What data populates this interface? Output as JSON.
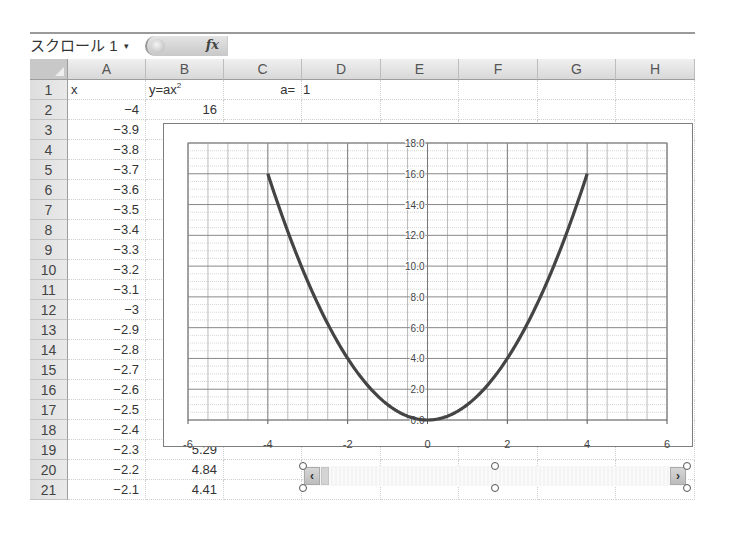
{
  "formula_bar": {
    "name_box": "スクロール 1",
    "name_box_arrow": "▾",
    "fx_label": "fx",
    "formula": ""
  },
  "columns": [
    "A",
    "B",
    "C",
    "D",
    "E",
    "F",
    "G",
    "H"
  ],
  "rows": [
    {
      "n": "1",
      "A": "x",
      "B": "y=ax",
      "B_sup": "2",
      "C": "a=",
      "D": "1"
    },
    {
      "n": "2",
      "A": "−4",
      "B": "16"
    },
    {
      "n": "3",
      "A": "−3.9"
    },
    {
      "n": "4",
      "A": "−3.8"
    },
    {
      "n": "5",
      "A": "−3.7"
    },
    {
      "n": "6",
      "A": "−3.6"
    },
    {
      "n": "7",
      "A": "−3.5"
    },
    {
      "n": "8",
      "A": "−3.4"
    },
    {
      "n": "9",
      "A": "−3.3"
    },
    {
      "n": "10",
      "A": "−3.2"
    },
    {
      "n": "11",
      "A": "−3.1"
    },
    {
      "n": "12",
      "A": "−3"
    },
    {
      "n": "13",
      "A": "−2.9"
    },
    {
      "n": "14",
      "A": "−2.8"
    },
    {
      "n": "15",
      "A": "−2.7"
    },
    {
      "n": "16",
      "A": "−2.6"
    },
    {
      "n": "17",
      "A": "−2.5"
    },
    {
      "n": "18",
      "A": "−2.4"
    },
    {
      "n": "19",
      "A": "−2.3",
      "B": "5.29"
    },
    {
      "n": "20",
      "A": "−2.2",
      "B": "4.84"
    },
    {
      "n": "21",
      "A": "−2.1",
      "B": "4.41"
    }
  ],
  "scroll_control": {
    "left_arrow": "‹",
    "right_arrow": "›"
  },
  "chart_data": {
    "type": "scatter",
    "title": "",
    "xlabel": "",
    "ylabel": "",
    "xlim": [
      -6,
      6
    ],
    "ylim": [
      0,
      18
    ],
    "x_ticks": [
      "-6",
      "-4",
      "-2",
      "0",
      "2",
      "4",
      "6"
    ],
    "y_ticks": [
      "0.0",
      "2.0",
      "4.0",
      "6.0",
      "8.0",
      "10.0",
      "12.0",
      "14.0",
      "16.0",
      "18.0"
    ],
    "grid": true,
    "legend": "none",
    "series": [
      {
        "name": "y=ax^2 (a=1)",
        "x": [
          -4,
          -3.5,
          -3,
          -2.5,
          -2,
          -1.5,
          -1,
          -0.5,
          0,
          0.5,
          1,
          1.5,
          2,
          2.5,
          3,
          3.5,
          4
        ],
        "y": [
          16,
          12.25,
          9,
          6.25,
          4,
          2.25,
          1,
          0.25,
          0,
          0.25,
          1,
          2.25,
          4,
          6.25,
          9,
          12.25,
          16
        ]
      }
    ],
    "line_color": "#444444"
  }
}
